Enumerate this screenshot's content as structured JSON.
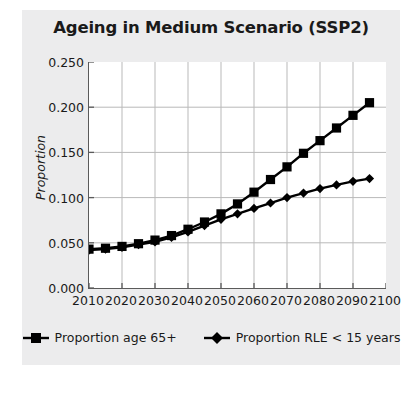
{
  "chart_data": {
    "type": "line",
    "title": "Ageing in Medium Scenario (SSP2)",
    "xlabel": "",
    "ylabel": "Proportion",
    "xlim": [
      2010,
      2100
    ],
    "ylim": [
      0.0,
      0.25
    ],
    "grid": true,
    "legend_position": "bottom",
    "x": [
      2010,
      2015,
      2020,
      2025,
      2030,
      2035,
      2040,
      2045,
      2050,
      2055,
      2060,
      2065,
      2070,
      2075,
      2080,
      2085,
      2090,
      2095
    ],
    "xticks": [
      "2010",
      "2020",
      "2030",
      "2040",
      "2050",
      "2060",
      "2070",
      "2080",
      "2090",
      "2100"
    ],
    "xtick_values": [
      2010,
      2020,
      2030,
      2040,
      2050,
      2060,
      2070,
      2080,
      2090,
      2100
    ],
    "yticks": [
      "0.000",
      "0.050",
      "0.100",
      "0.150",
      "0.200",
      "0.250"
    ],
    "ytick_values": [
      0.0,
      0.05,
      0.1,
      0.15,
      0.2,
      0.25
    ],
    "series": [
      {
        "name": "Proportion age 65+",
        "marker": "square",
        "color": "#000000",
        "values": [
          0.043,
          0.044,
          0.046,
          0.049,
          0.053,
          0.058,
          0.065,
          0.073,
          0.082,
          0.093,
          0.106,
          0.12,
          0.134,
          0.149,
          0.163,
          0.177,
          0.191,
          0.205
        ]
      },
      {
        "name": "Proportion RLE < 15 years",
        "marker": "diamond",
        "color": "#000000",
        "values": [
          0.042,
          0.043,
          0.045,
          0.048,
          0.051,
          0.056,
          0.062,
          0.069,
          0.076,
          0.082,
          0.088,
          0.094,
          0.1,
          0.105,
          0.11,
          0.114,
          0.118,
          0.121
        ]
      }
    ]
  }
}
